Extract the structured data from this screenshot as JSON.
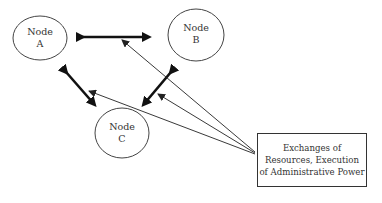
{
  "diagram": {
    "nodes": [
      {
        "id": "A",
        "line1": "Node",
        "line2": "A"
      },
      {
        "id": "B",
        "line1": "Node",
        "line2": "B"
      },
      {
        "id": "C",
        "line1": "Node",
        "line2": "C"
      }
    ],
    "box": {
      "line1": "Exchanges of",
      "line2": "Resources, Execution",
      "line3": "of Administrative Power"
    },
    "edges": [
      {
        "from": "A",
        "to": "B",
        "type": "bidirectional-thick"
      },
      {
        "from": "A",
        "to": "C",
        "type": "bidirectional-thick"
      },
      {
        "from": "B",
        "to": "C",
        "type": "bidirectional-thick"
      },
      {
        "from": "box",
        "to": "A-B edge",
        "type": "thin-arrow"
      },
      {
        "from": "box",
        "to": "A-C edge",
        "type": "thin-arrow"
      },
      {
        "from": "box",
        "to": "B-C edge",
        "type": "thin-arrow"
      }
    ],
    "colors": {
      "stroke": "#333333",
      "text": "#333333",
      "background": "#ffffff"
    }
  }
}
